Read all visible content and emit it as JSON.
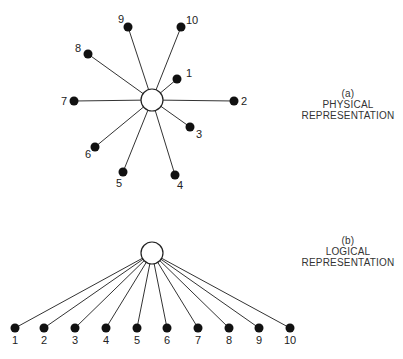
{
  "physical": {
    "caption": {
      "tag": "(a)",
      "line1": "PHYSICAL",
      "line2": "REPRESENTATION"
    },
    "hub": {
      "x": 152,
      "y": 100,
      "r": 11
    },
    "nodes": [
      {
        "label": "1",
        "x": 177,
        "y": 79,
        "lx": 186,
        "ly": 77
      },
      {
        "label": "2",
        "x": 234,
        "y": 101,
        "lx": 241,
        "ly": 105
      },
      {
        "label": "3",
        "x": 190,
        "y": 127,
        "lx": 196,
        "ly": 138
      },
      {
        "label": "4",
        "x": 175,
        "y": 175,
        "lx": 177,
        "ly": 189
      },
      {
        "label": "5",
        "x": 123,
        "y": 172,
        "lx": 116,
        "ly": 187
      },
      {
        "label": "6",
        "x": 95,
        "y": 147,
        "lx": 85,
        "ly": 158
      },
      {
        "label": "7",
        "x": 74,
        "y": 101,
        "lx": 61,
        "ly": 105
      },
      {
        "label": "8",
        "x": 88,
        "y": 54,
        "lx": 75,
        "ly": 52
      },
      {
        "label": "9",
        "x": 128,
        "y": 27,
        "lx": 118,
        "ly": 23
      },
      {
        "label": "10",
        "x": 181,
        "y": 27,
        "lx": 186,
        "ly": 24
      }
    ]
  },
  "logical": {
    "caption": {
      "tag": "(b)",
      "line1": "LOGICAL",
      "line2": "REPRESENTATION"
    },
    "hub": {
      "x": 152,
      "y": 253,
      "r": 11
    },
    "node_y": 328,
    "label_y": 344,
    "nodes": [
      {
        "label": "1",
        "x": 15
      },
      {
        "label": "2",
        "x": 44
      },
      {
        "label": "3",
        "x": 75
      },
      {
        "label": "4",
        "x": 106
      },
      {
        "label": "5",
        "x": 137
      },
      {
        "label": "6",
        "x": 167
      },
      {
        "label": "7",
        "x": 198
      },
      {
        "label": "8",
        "x": 229
      },
      {
        "label": "9",
        "x": 259
      },
      {
        "label": "10",
        "x": 290
      }
    ]
  }
}
